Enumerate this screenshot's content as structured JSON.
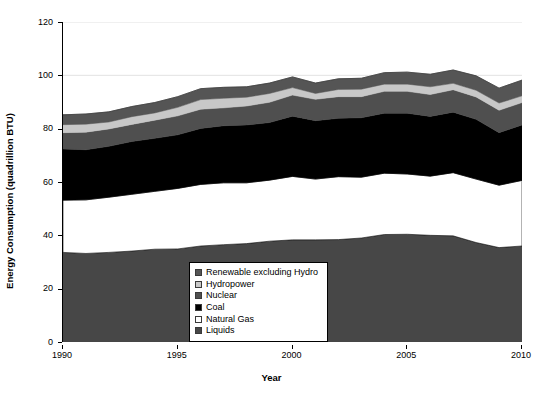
{
  "chart_data": {
    "type": "area",
    "title": "",
    "xlabel": "Year",
    "ylabel": "Energy Consumption (quadrillion BTU)",
    "xlim": [
      1990,
      2010
    ],
    "ylim": [
      0,
      120
    ],
    "yticks": [
      0,
      20,
      40,
      60,
      80,
      100,
      120
    ],
    "xticks": [
      1990,
      1995,
      2000,
      2005,
      2010
    ],
    "grid": true,
    "legend_position": "lower-center",
    "stacked": true,
    "stack_order_bottom_to_top": [
      "Liquids",
      "Natural Gas",
      "Coal",
      "Nuclear",
      "Hydropower",
      "Renewable excluding Hydro"
    ],
    "x": [
      1990,
      1991,
      1992,
      1993,
      1994,
      1995,
      1996,
      1997,
      1998,
      1999,
      2000,
      2001,
      2002,
      2003,
      2004,
      2005,
      2006,
      2007,
      2008,
      2009,
      2010
    ],
    "series": [
      {
        "name": "Liquids",
        "color": "#474747",
        "values": [
          33.6,
          33.2,
          33.6,
          34.1,
          34.8,
          34.9,
          36.0,
          36.5,
          36.9,
          37.8,
          38.3,
          38.3,
          38.4,
          39.0,
          40.3,
          40.4,
          40.0,
          39.8,
          37.3,
          35.4,
          36.0
        ]
      },
      {
        "name": "Natural Gas",
        "color": "#ffffff",
        "values": [
          19.6,
          20.1,
          20.7,
          21.3,
          21.7,
          22.7,
          23.1,
          23.2,
          22.8,
          22.9,
          23.8,
          22.8,
          23.6,
          22.8,
          23.0,
          22.6,
          22.2,
          23.7,
          23.8,
          23.4,
          24.6
        ]
      },
      {
        "name": "Coal",
        "color": "#000000",
        "values": [
          19.2,
          18.8,
          19.1,
          19.8,
          19.9,
          20.1,
          21.0,
          21.4,
          21.7,
          21.6,
          22.6,
          21.9,
          21.9,
          22.3,
          22.5,
          22.8,
          22.4,
          22.7,
          22.4,
          19.7,
          20.8
        ]
      },
      {
        "name": "Nuclear",
        "color": "#4f4f4f",
        "values": [
          6.1,
          6.6,
          6.5,
          6.4,
          6.8,
          7.1,
          7.2,
          6.7,
          7.1,
          7.6,
          7.9,
          8.0,
          8.1,
          7.9,
          8.2,
          8.2,
          8.2,
          8.4,
          8.4,
          8.4,
          8.4
        ]
      },
      {
        "name": "Hydropower",
        "color": "#c8c8c8",
        "values": [
          3.0,
          3.0,
          2.6,
          2.9,
          2.7,
          3.2,
          3.6,
          3.6,
          3.3,
          3.3,
          2.8,
          2.2,
          2.7,
          2.8,
          2.7,
          2.7,
          2.9,
          2.4,
          2.5,
          2.7,
          2.5
        ]
      },
      {
        "name": "Renewable excluding Hydro",
        "color": "#555555",
        "values": [
          3.7,
          3.8,
          3.8,
          3.8,
          3.9,
          4.0,
          4.1,
          4.1,
          3.9,
          3.9,
          4.0,
          3.9,
          4.0,
          4.1,
          4.3,
          4.5,
          4.7,
          5.0,
          5.4,
          5.6,
          5.9
        ]
      }
    ]
  },
  "legend": {
    "items": [
      {
        "label": "Renewable excluding Hydro",
        "color": "#555555"
      },
      {
        "label": "Hydropower",
        "color": "#c8c8c8"
      },
      {
        "label": "Nuclear",
        "color": "#4f4f4f"
      },
      {
        "label": "Coal",
        "color": "#000000"
      },
      {
        "label": "Natural Gas",
        "color": "#ffffff"
      },
      {
        "label": "Liquids",
        "color": "#474747"
      }
    ]
  },
  "axes": {
    "ylabel": "Energy Consumption (quadrillion BTU)",
    "xlabel": "Year",
    "ytick_labels": [
      "0",
      "20",
      "40",
      "60",
      "80",
      "100",
      "120"
    ],
    "xtick_labels": [
      "1990",
      "1995",
      "2000",
      "2005",
      "2010"
    ]
  }
}
